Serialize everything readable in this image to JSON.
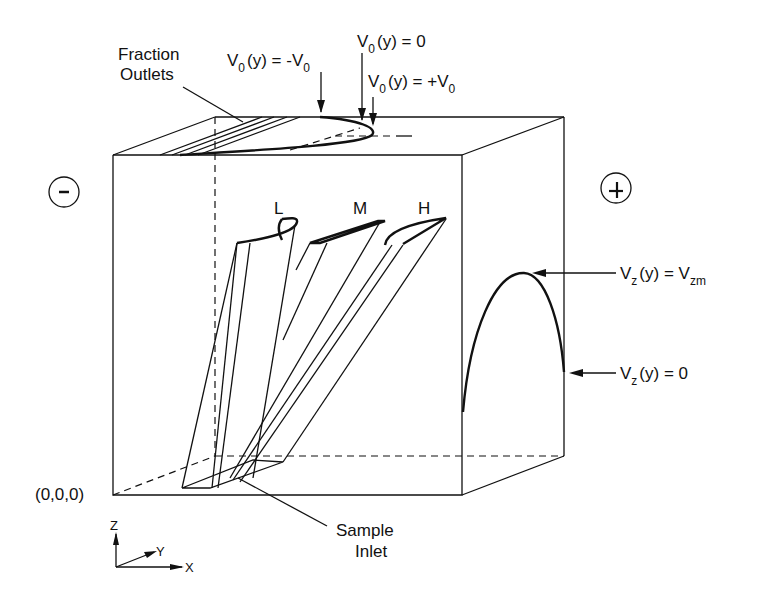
{
  "diagram": {
    "labels": {
      "fraction_outlets": [
        "Fraction",
        "Outlets"
      ],
      "v0_minus": {
        "base": "V",
        "sub": "0",
        "rest": "(y) = -V",
        "sub2": "0"
      },
      "v0_zero": {
        "base": "V",
        "sub": "0",
        "rest": "(y) = 0"
      },
      "v0_plus": {
        "base": "V",
        "sub": "0",
        "rest": "(y) = +V",
        "sub2": "0"
      },
      "vz_max": {
        "base": "V",
        "sub": "z",
        "rest": "(y) = V",
        "sub2": "zm"
      },
      "vz_zero": {
        "base": "V",
        "sub": "z",
        "rest": "(y) = 0"
      },
      "origin": "(0,0,0)",
      "sample_inlet": [
        "Sample",
        "Inlet"
      ],
      "band_low": "L",
      "band_mid": "M",
      "band_high": "H",
      "electrode_negative": "-",
      "electrode_positive": "+",
      "axis_z": "Z",
      "axis_y": "Y",
      "axis_x": "X"
    },
    "colors": {
      "ink": "#111111",
      "background": "#ffffff"
    }
  }
}
